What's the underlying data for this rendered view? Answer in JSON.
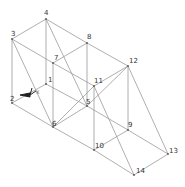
{
  "diagram": {
    "type": "3d-truss-wireframe",
    "nodes": [
      {
        "id": "1",
        "x": 46,
        "y": 84,
        "lx": 2,
        "ly": -2
      },
      {
        "id": "2",
        "x": 12,
        "y": 103,
        "lx": -2,
        "ly": -2
      },
      {
        "id": "3",
        "x": 12,
        "y": 39,
        "lx": -1,
        "ly": -3
      },
      {
        "id": "4",
        "x": 46,
        "y": 19,
        "lx": -2,
        "ly": -4
      },
      {
        "id": "5",
        "x": 87,
        "y": 106,
        "lx": -1,
        "ly": -2
      },
      {
        "id": "6",
        "x": 53,
        "y": 127,
        "lx": -1,
        "ly": -1
      },
      {
        "id": "7",
        "x": 53,
        "y": 63,
        "lx": 1,
        "ly": -3
      },
      {
        "id": "8",
        "x": 87,
        "y": 43,
        "lx": 0,
        "ly": -4
      },
      {
        "id": "9",
        "x": 128,
        "y": 130,
        "lx": 0,
        "ly": -3
      },
      {
        "id": "10",
        "x": 94,
        "y": 150,
        "lx": 1,
        "ly": -2
      },
      {
        "id": "11",
        "x": 94,
        "y": 86,
        "lx": 0,
        "ly": -3
      },
      {
        "id": "12",
        "x": 128,
        "y": 66,
        "lx": 1,
        "ly": -3
      },
      {
        "id": "13",
        "x": 168,
        "y": 154,
        "lx": 1,
        "ly": -1
      },
      {
        "id": "14",
        "x": 134,
        "y": 175,
        "lx": 2,
        "ly": -2
      }
    ],
    "edges": [
      [
        "3",
        "4"
      ],
      [
        "4",
        "8"
      ],
      [
        "8",
        "12"
      ],
      [
        "3",
        "7"
      ],
      [
        "7",
        "8"
      ],
      [
        "7",
        "11"
      ],
      [
        "11",
        "12"
      ],
      [
        "3",
        "2"
      ],
      [
        "4",
        "1"
      ],
      [
        "7",
        "6"
      ],
      [
        "8",
        "5"
      ],
      [
        "2",
        "1"
      ],
      [
        "1",
        "5"
      ],
      [
        "2",
        "6"
      ],
      [
        "6",
        "5"
      ],
      [
        "3",
        "6"
      ],
      [
        "4",
        "5"
      ],
      [
        "6",
        "11"
      ],
      [
        "12",
        "5"
      ],
      [
        "12",
        "9"
      ],
      [
        "12",
        "13"
      ],
      [
        "11",
        "10"
      ],
      [
        "11",
        "14"
      ],
      [
        "5",
        "9"
      ],
      [
        "9",
        "13"
      ],
      [
        "9",
        "10"
      ],
      [
        "6",
        "10"
      ],
      [
        "10",
        "14"
      ],
      [
        "13",
        "14"
      ]
    ],
    "triad": {
      "origin": [
        30,
        95
      ],
      "labels": {
        "x": "X",
        "y": "Y",
        "z": "Z"
      },
      "color": "#222222"
    },
    "edge_color": "#9a9a9a",
    "label_color": "#333333"
  }
}
